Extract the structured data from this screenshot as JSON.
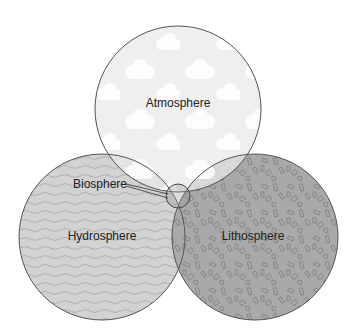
{
  "diagram": {
    "type": "venn",
    "circles": [
      {
        "id": "atmosphere",
        "label": "Atmosphere",
        "cx": 178,
        "cy": 109,
        "r": 83,
        "fill": "#e9e9e9",
        "pattern": "clouds"
      },
      {
        "id": "hydrosphere",
        "label": "Hydrosphere",
        "cx": 102,
        "cy": 237,
        "r": 83,
        "fill": "#d2d2d2",
        "pattern": "waves"
      },
      {
        "id": "lithosphere",
        "label": "Lithosphere",
        "cx": 255,
        "cy": 237,
        "r": 83,
        "fill": "#a9a9a9",
        "pattern": "rocks"
      }
    ],
    "center": {
      "id": "biosphere",
      "label": "Biosphere",
      "cx": 178,
      "cy": 196,
      "r": 12
    }
  },
  "labels": {
    "atmosphere": "Atmosphere",
    "hydrosphere": "Hydrosphere",
    "lithosphere": "Lithosphere",
    "biosphere": "Biosphere"
  },
  "colors": {
    "outline": "#555555",
    "atmosphere": "#e9e9e9",
    "hydrosphere": "#d2d2d2",
    "lithosphere": "#a9a9a9",
    "cloud": "#ffffff",
    "wave": "#b4b4b4",
    "rock": "#808080"
  }
}
